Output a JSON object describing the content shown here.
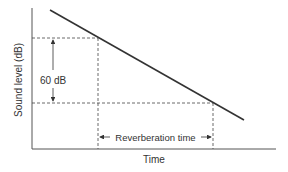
{
  "diagram": {
    "ylabel": "Sound level (dB)",
    "xlabel": "Time",
    "level_drop_label": "60 dB",
    "interval_label": "Reverberation time",
    "colors": {
      "line": "#333333",
      "axis": "#555555",
      "dash": "#444444"
    }
  }
}
